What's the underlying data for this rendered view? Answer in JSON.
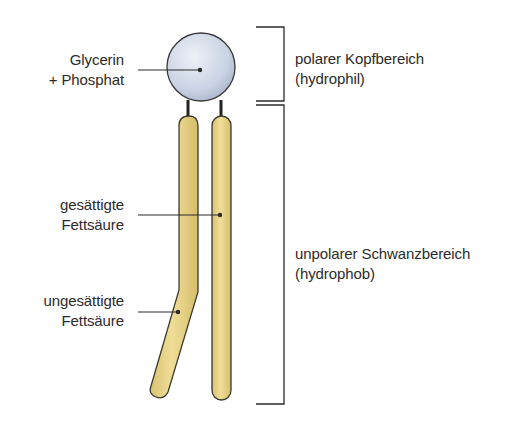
{
  "diagram": {
    "labels": {
      "head": {
        "line1": "Glycerin",
        "line2": "+ Phosphat"
      },
      "saturated": {
        "line1": "gesättigte",
        "line2": "Fettsäure"
      },
      "unsaturated": {
        "line1": "ungesättigte",
        "line2": "Fettsäure"
      },
      "head_region": {
        "line1": "polarer Kopfbereich",
        "line2": "(hydrophil)"
      },
      "tail_region": {
        "line1": "unpolarer Schwanzbereich",
        "line2": "(hydrophob)"
      }
    },
    "colors": {
      "head_fill": "#c9d3e4",
      "tail_fill": "#ead588",
      "outline": "#3a3a2e",
      "text": "#2b2b2b"
    }
  }
}
